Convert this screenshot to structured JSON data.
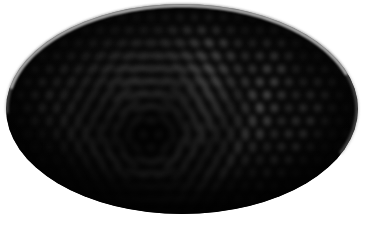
{
  "canvas": {
    "width": 365,
    "height": 235,
    "background_color": "#ffffff",
    "alt_text": "Dark elliptical object covered in a grid of faint gray dots that stretch into curved streaks near the center"
  },
  "ellipse": {
    "name": "dark-ellipse-body",
    "center_x": 182,
    "center_y": 109,
    "radius_x": 176,
    "radius_y": 105,
    "rotation_deg": -2,
    "fill_color": "#070707",
    "core_color": "#010101"
  },
  "rim": {
    "name": "rim-highlight",
    "color": "#c9c9c9",
    "secondary_color": "#8a8a8a",
    "thickness_px": 3,
    "arc_start_deg": 160,
    "arc_end_deg": 20,
    "description": "thin light gray specular rim along the upper arc, brightest at top-left, fading at bottom"
  },
  "dot_field": {
    "name": "dot-grid-pattern",
    "grid_type": "hexagonal",
    "pitch_x": 14.5,
    "pitch_y": 13.0,
    "dot_radius": 4.6,
    "dot_color": "#6a6a6a",
    "dot_color_dim": "#2a2a2a",
    "blur_px": 2.4,
    "rows": 17,
    "cols": 26,
    "description": "quasi-hexagonal lattice of soft gray dots filling the ellipse interior"
  },
  "caustic": {
    "name": "caustic-streak-zone",
    "focus_x": 150,
    "focus_y": 136,
    "inner_radius": 10,
    "outer_radius": 130,
    "max_stretch": 4.2,
    "streak_color": "#585858",
    "streak_color_bright": "#7d7d7d",
    "description": "dots elongate into curved tangential streaks radiating around the focal point, forming a moire caustic"
  },
  "vignette": {
    "name": "edge-vignette",
    "color": "#000000",
    "inner_stop": 0.52,
    "outer_stop": 1.0,
    "strength": 0.95
  },
  "shadow": {
    "name": "bottom-shadow",
    "color": "#000000",
    "opacity": 0.55
  }
}
